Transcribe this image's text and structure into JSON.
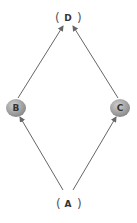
{
  "diagram": {
    "nodes": [
      {
        "id": "D",
        "label": "D",
        "style": "bracket"
      },
      {
        "id": "B",
        "label": "B",
        "style": "circle"
      },
      {
        "id": "C",
        "label": "C",
        "style": "circle"
      },
      {
        "id": "A",
        "label": "A",
        "style": "bracket"
      }
    ],
    "edges": [
      {
        "from": "A",
        "to": "B"
      },
      {
        "from": "A",
        "to": "C"
      },
      {
        "from": "B",
        "to": "D"
      },
      {
        "from": "C",
        "to": "D"
      }
    ],
    "colors": {
      "line": "#666666",
      "circle": "#9a9a9a",
      "text": "#333333"
    }
  }
}
